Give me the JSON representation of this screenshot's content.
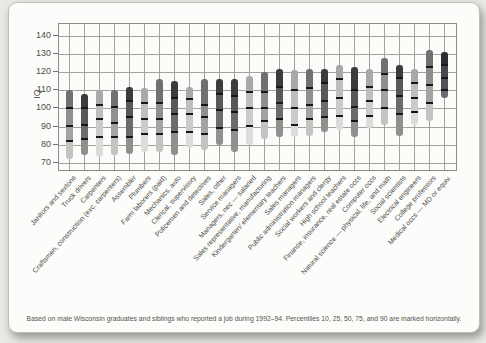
{
  "chart_data": {
    "type": "bar",
    "subtype": "vertical-percentile-range-bars",
    "title": "",
    "ylabel": "IQ",
    "xlabel": "",
    "ylim": [
      65,
      148
    ],
    "yticks": [
      140,
      130,
      120,
      110,
      100,
      90,
      80,
      70
    ],
    "grid": "both",
    "legend": "none",
    "percentiles_marked": [
      10,
      25,
      50,
      75,
      90
    ],
    "footnote": "Based on male Wisconsin graduates and siblings who reported a job during 1992–94. Percentiles 10, 25, 50, 75, and 90 are marked horizontally.",
    "palette": {
      "dark": {
        "top": "#3b3b3d",
        "base": "#58585a",
        "base2": "#6b6b6d",
        "bottom": "#90908f"
      },
      "medium": {
        "top": "#707072",
        "base": "#8f8f91",
        "base2": "#a3a3a5",
        "bottom": "#c3c3c2"
      },
      "light": {
        "top": "#a8a8aa",
        "base": "#bebec0",
        "base2": "#cbcbcd",
        "bottom": "#dcdcda"
      },
      "xdark": {
        "top": "#2c2c32",
        "base": "#46464c",
        "base2": "#525258",
        "bottom": "#6a6a70"
      }
    },
    "occupations": [
      {
        "label": "Janitors and sextons",
        "p10": 72,
        "p25": 82,
        "p50": 90,
        "p75": 100,
        "p90": 110,
        "shade": "medium"
      },
      {
        "label": "Truck drivers",
        "p10": 74,
        "p25": 83,
        "p50": 91,
        "p75": 100,
        "p90": 108,
        "shade": "dark"
      },
      {
        "label": "Carpenters",
        "p10": 73,
        "p25": 84,
        "p50": 94,
        "p75": 102,
        "p90": 110,
        "shade": "light"
      },
      {
        "label": "Craftsmen, construction (exc. carpenters)",
        "p10": 74,
        "p25": 84,
        "p50": 92,
        "p75": 101,
        "p90": 110,
        "shade": "medium"
      },
      {
        "label": "Assembler",
        "p10": 75,
        "p25": 84,
        "p50": 95,
        "p75": 104,
        "p90": 112,
        "shade": "dark"
      },
      {
        "label": "Plumbers",
        "p10": 76,
        "p25": 86,
        "p50": 94,
        "p75": 103,
        "p90": 111,
        "shade": "light"
      },
      {
        "label": "Farm laborers (paid)",
        "p10": 76,
        "p25": 86,
        "p50": 94,
        "p75": 103,
        "p90": 116,
        "shade": "medium"
      },
      {
        "label": "Mechanics, auto",
        "p10": 74,
        "p25": 87,
        "p50": 97,
        "p75": 106,
        "p90": 115,
        "shade": "dark"
      },
      {
        "label": "Clerical, supervisory",
        "p10": 78,
        "p25": 87,
        "p50": 97,
        "p75": 105,
        "p90": 112,
        "shade": "light"
      },
      {
        "label": "Policemen and detectives",
        "p10": 77,
        "p25": 86,
        "p50": 95,
        "p75": 102,
        "p90": 116,
        "shade": "medium"
      },
      {
        "label": "Sales, other",
        "p10": 80,
        "p25": 89,
        "p50": 99,
        "p75": 108,
        "p90": 116,
        "shade": "dark"
      },
      {
        "label": "Service managers",
        "p10": 76,
        "p25": 88,
        "p50": 98,
        "p75": 107,
        "p90": 116,
        "shade": "dark"
      },
      {
        "label": "Managers, nec — salaried",
        "p10": 80,
        "p25": 90,
        "p50": 100,
        "p75": 109,
        "p90": 118,
        "shade": "light"
      },
      {
        "label": "Sales representative, manufacturing",
        "p10": 83,
        "p25": 93,
        "p50": 100,
        "p75": 109,
        "p90": 120,
        "shade": "medium"
      },
      {
        "label": "Kindergarten/ elementary teachers",
        "p10": 84,
        "p25": 94,
        "p50": 103,
        "p75": 112,
        "p90": 122,
        "shade": "dark"
      },
      {
        "label": "Sales managers",
        "p10": 84,
        "p25": 91,
        "p50": 100,
        "p75": 110,
        "p90": 121,
        "shade": "light"
      },
      {
        "label": "Public administration managers",
        "p10": 85,
        "p25": 94,
        "p50": 102,
        "p75": 111,
        "p90": 122,
        "shade": "medium"
      },
      {
        "label": "Social workers and clergy",
        "p10": 87,
        "p25": 95,
        "p50": 104,
        "p75": 114,
        "p90": 122,
        "shade": "dark"
      },
      {
        "label": "High school teachers",
        "p10": 88,
        "p25": 96,
        "p50": 106,
        "p75": 116,
        "p90": 124,
        "shade": "light"
      },
      {
        "label": "Finance, insurance, real estate occs",
        "p10": 84,
        "p25": 93,
        "p50": 101,
        "p75": 110,
        "p90": 123,
        "shade": "dark"
      },
      {
        "label": "Computer occs",
        "p10": 89,
        "p25": 96,
        "p50": 104,
        "p75": 112,
        "p90": 122,
        "shade": "light"
      },
      {
        "label": "Natural science — physical, life, and math",
        "p10": 91,
        "p25": 100,
        "p50": 110,
        "p75": 119,
        "p90": 128,
        "shade": "medium"
      },
      {
        "label": "Social scientists",
        "p10": 85,
        "p25": 97,
        "p50": 107,
        "p75": 117,
        "p90": 124,
        "shade": "dark"
      },
      {
        "label": "Electrical engineers",
        "p10": 91,
        "p25": 98,
        "p50": 106,
        "p75": 114,
        "p90": 122,
        "shade": "light"
      },
      {
        "label": "College professors",
        "p10": 93,
        "p25": 103,
        "p50": 113,
        "p75": 123,
        "p90": 132,
        "shade": "medium"
      },
      {
        "label": "Medical occs — MD or equiv.",
        "p10": 106,
        "p25": 110,
        "p50": 117,
        "p75": 124,
        "p90": 131,
        "shade": "xdark"
      }
    ]
  }
}
